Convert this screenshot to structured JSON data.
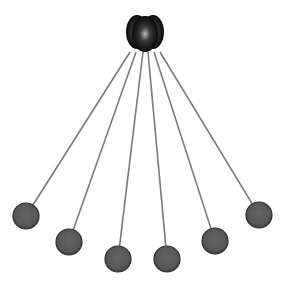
{
  "scene": {
    "title": "Pendulum balls hanging from a hub",
    "width": 286,
    "height": 283,
    "background": "#ffffff",
    "hub": {
      "cx": 145,
      "cy": 33,
      "lobes": [
        {
          "cx": 137,
          "cy": 32,
          "rx": 11,
          "ry": 17
        },
        {
          "cx": 153,
          "cy": 32,
          "rx": 11,
          "ry": 17
        },
        {
          "cx": 145,
          "cy": 34,
          "rx": 13,
          "ry": 18
        }
      ],
      "color_dark": "#000000",
      "color_mid": "#3a3a3a",
      "color_highlight": "#bdbdbd"
    },
    "string_color": "#7a7a7a",
    "ball_color": "#5a5a5a",
    "ball_edge": "#2e2e2e",
    "ball_radius": 13,
    "balls": [
      {
        "id": 1,
        "x1": 130,
        "y1": 52,
        "cx": 26,
        "cy": 216
      },
      {
        "id": 2,
        "x1": 136,
        "y1": 52,
        "cx": 69,
        "cy": 242
      },
      {
        "id": 3,
        "x1": 143,
        "y1": 52,
        "cx": 118,
        "cy": 259
      },
      {
        "id": 4,
        "x1": 148,
        "y1": 52,
        "cx": 167,
        "cy": 259
      },
      {
        "id": 5,
        "x1": 154,
        "y1": 52,
        "cx": 215,
        "cy": 241
      },
      {
        "id": 6,
        "x1": 160,
        "y1": 52,
        "cx": 259,
        "cy": 215
      }
    ]
  }
}
